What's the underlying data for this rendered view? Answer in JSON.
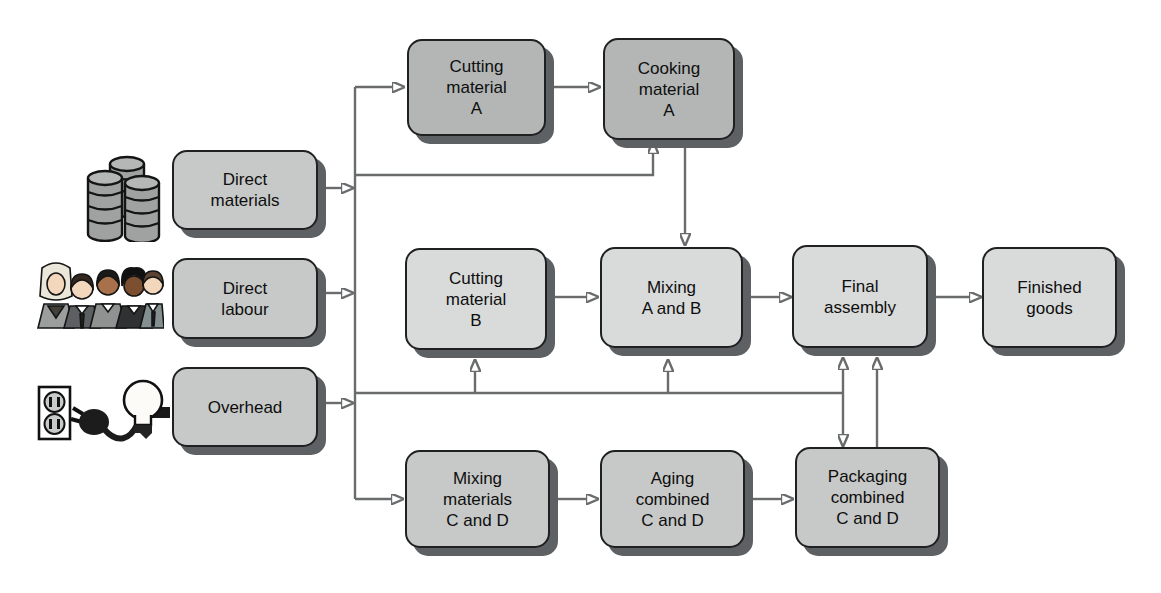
{
  "nodes": {
    "direct_materials": {
      "label": "Direct\nmaterials"
    },
    "direct_labour": {
      "label": "Direct\nlabour"
    },
    "overhead": {
      "label": "Overhead"
    },
    "cutting_a": {
      "label": "Cutting\nmaterial\nA"
    },
    "cooking_a": {
      "label": "Cooking\nmaterial\nA"
    },
    "cutting_b": {
      "label": "Cutting\nmaterial\nB"
    },
    "mixing_ab": {
      "label": "Mixing\nA and B"
    },
    "final_assembly": {
      "label": "Final\nassembly"
    },
    "finished_goods": {
      "label": "Finished\ngoods"
    },
    "mixing_cd": {
      "label": "Mixing\nmaterials\nC and D"
    },
    "aging_cd": {
      "label": "Aging\ncombined\nC and D"
    },
    "packaging_cd": {
      "label": "Packaging\ncombined\nC and D"
    }
  },
  "icons": [
    {
      "name": "oil-drums-icon",
      "represents": "direct_materials"
    },
    {
      "name": "workers-icon",
      "represents": "direct_labour"
    },
    {
      "name": "plug-lightbulb-icon",
      "represents": "overhead"
    }
  ],
  "edges": [
    {
      "from": "direct_materials",
      "to": "input_bus"
    },
    {
      "from": "direct_labour",
      "to": "input_bus"
    },
    {
      "from": "overhead",
      "to": "input_bus"
    },
    {
      "from": "input_bus",
      "to": "cutting_a"
    },
    {
      "from": "input_bus",
      "to": "cooking_a"
    },
    {
      "from": "input_bus",
      "to": "cutting_b"
    },
    {
      "from": "input_bus",
      "to": "mixing_ab"
    },
    {
      "from": "input_bus",
      "to": "final_assembly"
    },
    {
      "from": "input_bus",
      "to": "packaging_cd"
    },
    {
      "from": "input_bus",
      "to": "mixing_cd"
    },
    {
      "from": "cutting_a",
      "to": "cooking_a"
    },
    {
      "from": "cooking_a",
      "to": "mixing_ab"
    },
    {
      "from": "cutting_b",
      "to": "mixing_ab"
    },
    {
      "from": "mixing_ab",
      "to": "final_assembly"
    },
    {
      "from": "final_assembly",
      "to": "finished_goods"
    },
    {
      "from": "mixing_cd",
      "to": "aging_cd"
    },
    {
      "from": "aging_cd",
      "to": "packaging_cd"
    },
    {
      "from": "packaging_cd",
      "to": "final_assembly"
    }
  ],
  "colors": {
    "box_dark": "#b3b6b5",
    "box_medium": "#c7c9c8",
    "box_light": "#d9dbda",
    "box_border": "#1f2022",
    "box_shadow": "#5d6163",
    "connector": "#696b6c",
    "arrowhead": "#55585a",
    "background": "#ffffff",
    "text": "#0e0e0e"
  }
}
